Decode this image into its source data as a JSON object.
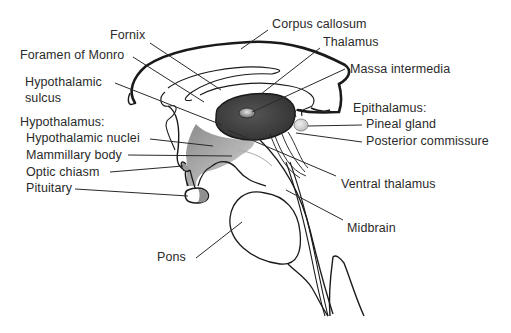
{
  "diagram": {
    "colors": {
      "outline": "#1a1a1a",
      "thalamus_fill": "#3c3c3c",
      "hypothalamus_fill": "#a8a8a8",
      "pineal_fill": "#d8d8d8",
      "leader_line": "#2a2a2a",
      "background": "#ffffff"
    },
    "labels": {
      "fornix": "Fornix",
      "foramen_of_monro": "Foramen of Monro",
      "hypothalamic_sulcus_1": "Hypothalamic",
      "hypothalamic_sulcus_2": "sulcus",
      "hypothalamus_heading": "Hypothalamus:",
      "hypothalamic_nuclei": "Hypothalamic nuclei",
      "mammillary_body": "Mammillary body",
      "optic_chiasm": "Optic chiasm",
      "pituitary": "Pituitary",
      "pons": "Pons",
      "corpus_callosum": "Corpus callosum",
      "thalamus": "Thalamus",
      "massa_intermedia": "Massa intermedia",
      "epithalamus_heading": "Epithalamus:",
      "pineal_gland": "Pineal gland",
      "posterior_commissure": "Posterior commissure",
      "ventral_thalamus": "Ventral thalamus",
      "midbrain": "Midbrain"
    }
  }
}
